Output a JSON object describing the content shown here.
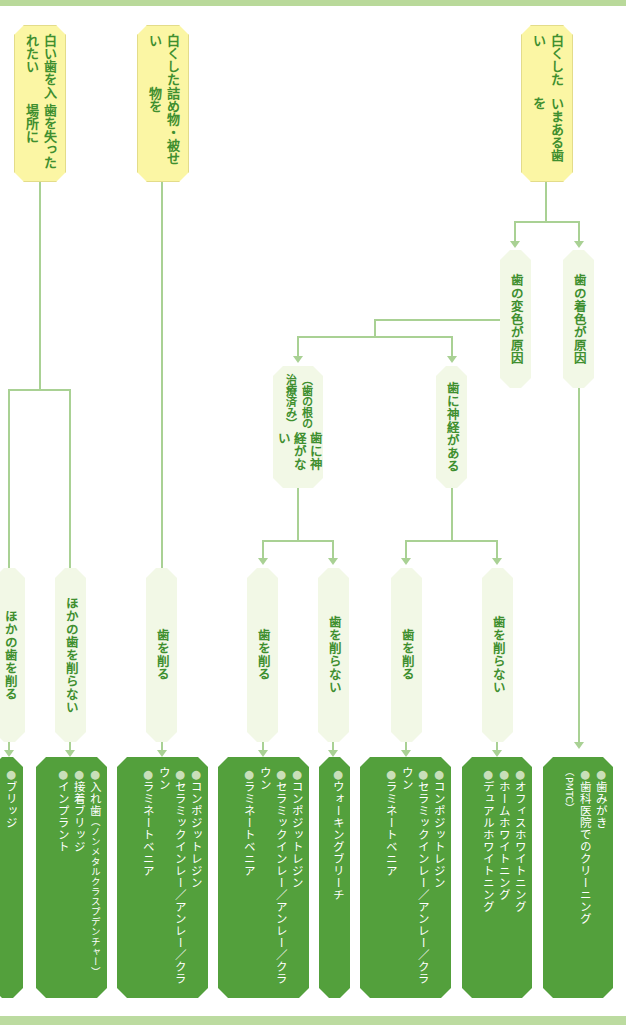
{
  "diagram": {
    "colors": {
      "goal_box": "#fbf6a4",
      "condition_box": "#f2f8e6",
      "result_box": "#53a03c",
      "text_green": "#3f8f2f",
      "connector": "#a9d194"
    },
    "goals": [
      {
        "id": "g1",
        "label": "いまある歯を白くしたい",
        "line1": "いまある歯を",
        "line2": "白くしたい"
      },
      {
        "id": "g2",
        "label": "詰め物・被せ物を白くしたい",
        "line1": "詰め物・被せ物を",
        "line2": "白くしたい"
      },
      {
        "id": "g3",
        "label": "歯を失った場所に白い歯を入れたい",
        "line1": "歯を失った場所に",
        "line2": "白い歯を入れたい"
      }
    ],
    "causes": [
      {
        "id": "c1",
        "label": "歯の着色が原因"
      },
      {
        "id": "c2",
        "label": "歯の変色が原因"
      }
    ],
    "nerve": [
      {
        "id": "n1",
        "label": "歯に神経がある"
      },
      {
        "id": "n2",
        "label": "歯に神経がない",
        "sub": "（歯の根の治療済み）"
      }
    ],
    "actions": [
      {
        "id": "a1",
        "label": "歯を削らない"
      },
      {
        "id": "a2",
        "label": "歯を削る"
      },
      {
        "id": "a3",
        "label": "歯を削らない"
      },
      {
        "id": "a4",
        "label": "歯を削る"
      },
      {
        "id": "a5",
        "label": "歯を削る"
      },
      {
        "id": "a6",
        "label": "ほかの歯を削らない"
      },
      {
        "id": "a7",
        "label": "ほかの歯を削る"
      }
    ],
    "results": [
      {
        "id": "r1",
        "items": [
          "歯みがき",
          "歯科医院でのクリーニング"
        ],
        "note": "（PMTC）"
      },
      {
        "id": "r2",
        "items": [
          "オフィスホワイトニング",
          "ホームホワイトニング",
          "デュアルホワイトニング"
        ]
      },
      {
        "id": "r3",
        "items": [
          "コンポジットレジン",
          "セラミックインレー／アンレー／クラウン",
          "ラミネートベニア"
        ]
      },
      {
        "id": "r4",
        "items": [
          "ウォーキングブリーチ"
        ]
      },
      {
        "id": "r5",
        "items": [
          "コンポジットレジン",
          "セラミックインレー／アンレー／クラウン",
          "ラミネートベニア"
        ]
      },
      {
        "id": "r6",
        "items": [
          "コンポジットレジン",
          "セラミックインレー／アンレー／クラウン",
          "ラミネートベニア"
        ]
      },
      {
        "id": "r7",
        "items": [
          "入れ歯",
          "接着ブリッジ",
          "インプラント"
        ],
        "note": "（ノンメタルクラスプデンチャー）"
      },
      {
        "id": "r8",
        "items": [
          "ブリッジ"
        ]
      }
    ],
    "bullet": "●"
  }
}
